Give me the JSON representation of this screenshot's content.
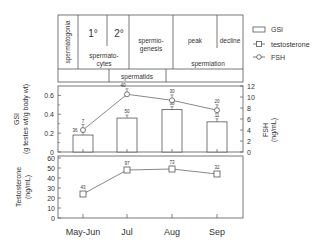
{
  "chart_data": {
    "type": "bar",
    "categories": [
      "May-Jun",
      "Jul",
      "Aug",
      "Sep"
    ],
    "stages_table": {
      "cells": [
        {
          "label": "spermatogonia",
          "vertical": true
        },
        {
          "label": "1°"
        },
        {
          "label": "2°"
        },
        {
          "label": "spermato-\ncytes"
        },
        {
          "label": "spermio-\ngenesis"
        },
        {
          "label": "peak"
        },
        {
          "label": "decline"
        },
        {
          "label": "spermiation"
        },
        {
          "label": "spermatids"
        }
      ]
    },
    "legend": [
      {
        "name": "GSI",
        "marker": "bar"
      },
      {
        "name": "testosterone",
        "marker": "square-line"
      },
      {
        "name": "FSH",
        "marker": "diamond-line"
      }
    ],
    "gsi_panel": {
      "ylabel": "GSI",
      "ylabel2": "(g testes wt/g body wt)",
      "ylim": [
        0,
        0.7
      ],
      "yticks": [
        "0",
        "0.2",
        "0.4",
        "0.6"
      ],
      "y2label": "FSH",
      "y2label2": "(ng/mL)",
      "y2lim": [
        0,
        12
      ],
      "y2ticks": [
        "0",
        "2",
        "4",
        "6",
        "8",
        "10",
        "12"
      ],
      "series": [
        {
          "name": "GSI",
          "type": "bar",
          "values": [
            0.18,
            0.36,
            0.45,
            0.32
          ],
          "n": [
            "36",
            "50",
            "38",
            "11"
          ]
        },
        {
          "name": "FSH",
          "type": "line",
          "values": [
            4.0,
            10.5,
            9.4,
            7.6
          ],
          "n": [
            "7",
            "40",
            "30",
            "20"
          ]
        }
      ]
    },
    "testosterone_panel": {
      "ylabel": "Testosterone",
      "ylabel2": "(ng/mL)",
      "ylim": [
        0,
        62
      ],
      "yticks": [
        "0",
        "10",
        "20",
        "30",
        "40",
        "50",
        "60"
      ],
      "series": [
        {
          "name": "testosterone",
          "type": "line",
          "values": [
            24,
            48,
            49,
            44
          ],
          "n": [
            "43",
            "97",
            "73",
            "32"
          ]
        }
      ]
    },
    "xlabel": ""
  }
}
